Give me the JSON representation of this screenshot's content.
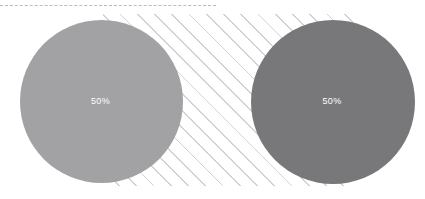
{
  "chart_data": {
    "type": "pie",
    "title": "",
    "xlabel": "",
    "ylabel": "",
    "legend_position": "none",
    "grid": false,
    "categories": [
      "Segment A",
      "Segment B"
    ],
    "values": [
      50,
      50
    ],
    "units": "percent",
    "series": [
      {
        "name": "Segment A",
        "value": 50,
        "label": "50%",
        "color": "#a2a2a4",
        "slice_fraction": 1.0
      },
      {
        "name": "Segment B",
        "value": 50,
        "label": "50%",
        "color": "#78787a",
        "slice_fraction": 1.0
      }
    ],
    "annotations": []
  },
  "canvas": {
    "width": 425,
    "height": 199,
    "background": "#ffffff"
  },
  "decorations": {
    "top_rule": {
      "name": "dashed-rule",
      "style": "dashed",
      "color": "#b9b9bd",
      "width_px": 216,
      "top_px": 5
    },
    "hatch": {
      "name": "diagonal-hatch-band",
      "angle_deg": 45,
      "line_color": "#d2d2d6",
      "spacing_px": 12,
      "left_px": 103,
      "top_px": 14,
      "width_px": 252,
      "height_px": 172
    }
  },
  "charts": [
    {
      "id": "pie-left",
      "name": "left-pie",
      "label": "50%",
      "color": "#a2a2a4",
      "value": 50
    },
    {
      "id": "pie-right",
      "name": "right-pie",
      "label": "50%",
      "color": "#78787a",
      "value": 50
    }
  ]
}
